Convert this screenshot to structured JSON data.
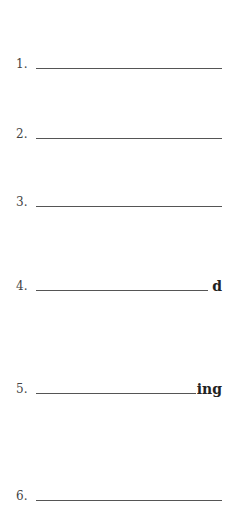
{
  "items": [
    {
      "number": "1.",
      "suffix": ""
    },
    {
      "number": "2.",
      "suffix": ""
    },
    {
      "number": "3.",
      "suffix": ""
    },
    {
      "number": "4.",
      "suffix": "d"
    },
    {
      "number": "5.",
      "suffix": "ing"
    },
    {
      "number": "6.",
      "suffix": ""
    }
  ]
}
